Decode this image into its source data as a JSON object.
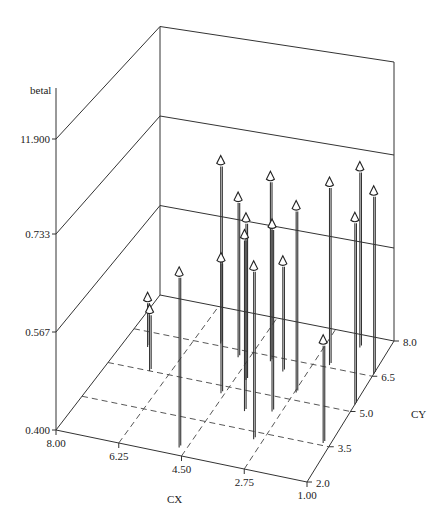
{
  "chart_data": {
    "type": "scatter3d-stem",
    "title": "",
    "zlabel": "betal",
    "xlabel": "CX",
    "ylabel": "CY",
    "x_ticks": [
      "8.00",
      "6.25",
      "4.50",
      "2.75",
      "1.00"
    ],
    "y_ticks": [
      "2.0",
      "3.5",
      "5.0",
      "6.5",
      "8.0"
    ],
    "z_ticks": [
      "0.400",
      "0.567",
      "0.733",
      "11.900"
    ],
    "xlim": [
      8.0,
      1.0
    ],
    "ylim": [
      2.0,
      8.0
    ],
    "zlim": [
      0.4,
      11.9
    ],
    "grid": true,
    "legend": "none",
    "points": [
      {
        "cx": 7.3,
        "cy": 5.9,
        "z": 0.49
      },
      {
        "cx": 6.8,
        "cy": 5.0,
        "z": 0.51
      },
      {
        "cx": 4.7,
        "cy": 2.3,
        "z": 0.7
      },
      {
        "cx": 5.5,
        "cy": 6.6,
        "z": 0.74
      },
      {
        "cx": 4.6,
        "cy": 4.7,
        "z": 0.64
      },
      {
        "cx": 4.8,
        "cy": 6.2,
        "z": 0.69
      },
      {
        "cx": 4.2,
        "cy": 5.4,
        "z": 0.69
      },
      {
        "cx": 3.7,
        "cy": 4.2,
        "z": 0.71
      },
      {
        "cx": 3.9,
        "cy": 6.3,
        "z": 0.87
      },
      {
        "cx": 3.0,
        "cy": 3.2,
        "z": 0.7
      },
      {
        "cx": 3.0,
        "cy": 4.4,
        "z": 0.73
      },
      {
        "cx": 3.4,
        "cy": 6.0,
        "z": 0.6
      },
      {
        "cx": 2.7,
        "cy": 5.3,
        "z": 0.78
      },
      {
        "cx": 2.3,
        "cy": 6.6,
        "z": 0.75
      },
      {
        "cx": 1.8,
        "cy": 7.5,
        "z": 0.79
      },
      {
        "cx": 1.2,
        "cy": 3.6,
        "z": 0.58
      },
      {
        "cx": 1.0,
        "cy": 5.3,
        "z": 0.8
      },
      {
        "cx": 1.0,
        "cy": 6.6,
        "z": 0.75
      }
    ]
  },
  "labels": {
    "zlabel": "betal",
    "xlabel": "CX",
    "ylabel": "CY"
  }
}
